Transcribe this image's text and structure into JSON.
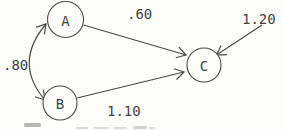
{
  "figure": {
    "type": "path-diagram",
    "background_color": "#fcfcfb",
    "line_color": "#4a4a48",
    "text_color": "#44423f",
    "nodes": [
      {
        "id": "A",
        "label": "A",
        "cx": 65.5,
        "cy": 19.5,
        "r": 18
      },
      {
        "id": "B",
        "label": "B",
        "cx": 60,
        "cy": 103,
        "r": 17
      },
      {
        "id": "C",
        "label": "C",
        "cx": 204,
        "cy": 65,
        "r": 17
      }
    ],
    "edges": [
      {
        "id": "A-to-C",
        "kind": "single-arrow",
        "label": ".60",
        "geometry": "M 83.5 25 L 186 55",
        "label_x": 127,
        "label_y": 19
      },
      {
        "id": "B-to-C",
        "kind": "single-arrow",
        "label": "1.10",
        "geometry": "M 77 98 L 184 72",
        "label_x": 107,
        "label_y": 116
      },
      {
        "id": "external-to-C",
        "kind": "single-arrow",
        "label": "1.20",
        "geometry": "M 262 25 L 216.5 55",
        "label_x": 242,
        "label_y": 24
      },
      {
        "id": "A-with-B",
        "kind": "double-arrow",
        "label": ".80",
        "geometry": "M 46 24 Q 13 63 45 100",
        "label_x": 3,
        "label_y": 70
      }
    ]
  }
}
